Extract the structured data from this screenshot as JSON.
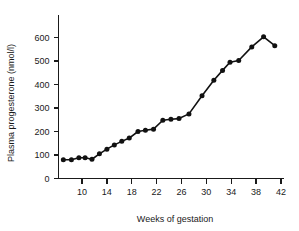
{
  "chart_data": {
    "type": "line",
    "title": "",
    "xlabel": "Weeks of gestation",
    "ylabel": "Plasma progesterone (nmol/l)",
    "xlim": [
      6,
      43
    ],
    "ylim": [
      0,
      650
    ],
    "grid": false,
    "legend": "none",
    "marker": "filled-circle",
    "line_color": "#111111",
    "xticks": [
      10,
      14,
      18,
      22,
      26,
      30,
      34,
      38,
      42
    ],
    "xtick_labels": [
      "10",
      "14",
      "18",
      "22",
      "26",
      "30",
      "34",
      "38",
      "42"
    ],
    "yticks": [
      0,
      100,
      200,
      300,
      400,
      500,
      600
    ],
    "ytick_labels": [
      "0",
      "100",
      "200",
      "300",
      "400",
      "500",
      "600"
    ],
    "series": [
      {
        "name": "Plasma progesterone",
        "x": [
          7.0,
          8.3,
          9.5,
          10.5,
          11.6,
          12.8,
          14.0,
          15.2,
          16.4,
          17.6,
          19.0,
          20.2,
          21.5,
          23.0,
          24.3,
          25.6,
          27.2,
          29.3,
          31.2,
          32.6,
          33.8,
          35.2,
          37.3,
          39.2,
          41.0
        ],
        "y": [
          80,
          80,
          88,
          88,
          82,
          105,
          125,
          143,
          158,
          172,
          200,
          205,
          210,
          248,
          252,
          255,
          275,
          352,
          418,
          460,
          495,
          502,
          560,
          603,
          565
        ]
      }
    ]
  },
  "figure": {
    "background_color": "#ffffff",
    "axis_color": "#1a1a1a"
  }
}
